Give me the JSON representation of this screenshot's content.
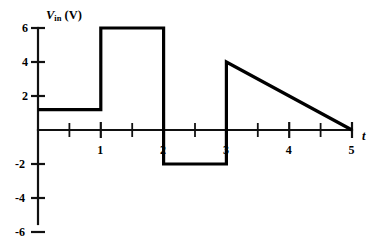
{
  "chart_data": {
    "type": "line",
    "title": "",
    "subtitle": "",
    "xlabel": "t",
    "ylabel": "V_in (V)",
    "ylabel_parts": {
      "symbol": "V",
      "subscript": "in",
      "unit": "(V)"
    },
    "xlim": [
      0,
      5
    ],
    "ylim": [
      -6,
      6
    ],
    "grid": false,
    "legend": null,
    "x_ticks_major": [
      1,
      2,
      3,
      4,
      5
    ],
    "x_tick_labels": [
      "1",
      "2",
      "3",
      "4",
      "5"
    ],
    "x_ticks_minor": [
      0.5,
      1.5,
      2.5,
      3.5,
      4.5
    ],
    "y_ticks_major": [
      6,
      4,
      2,
      -2,
      -4,
      -6
    ],
    "y_tick_labels": [
      "6",
      "4",
      "2",
      "-2",
      "-4",
      "-6"
    ],
    "series": [
      {
        "name": "Vin",
        "color": "#000000",
        "points": [
          {
            "x": 0,
            "y": 1.2
          },
          {
            "x": 1,
            "y": 1.2
          },
          {
            "x": 1,
            "y": 6
          },
          {
            "x": 2,
            "y": 6
          },
          {
            "x": 2,
            "y": -2
          },
          {
            "x": 3,
            "y": -2
          },
          {
            "x": 3,
            "y": 4
          },
          {
            "x": 5,
            "y": 0
          }
        ]
      }
    ],
    "segments": [
      {
        "label": "constant-1.2V",
        "x_start": 0,
        "x_end": 1,
        "y_start": 1.2,
        "y_end": 1.2
      },
      {
        "label": "constant-6V",
        "x_start": 1,
        "x_end": 2,
        "y_start": 6,
        "y_end": 6
      },
      {
        "label": "constant-minus-2V",
        "x_start": 2,
        "x_end": 3,
        "y_start": -2,
        "y_end": -2
      },
      {
        "label": "ramp-4V-to-0V",
        "x_start": 3,
        "x_end": 5,
        "y_start": 4,
        "y_end": 0
      }
    ]
  }
}
